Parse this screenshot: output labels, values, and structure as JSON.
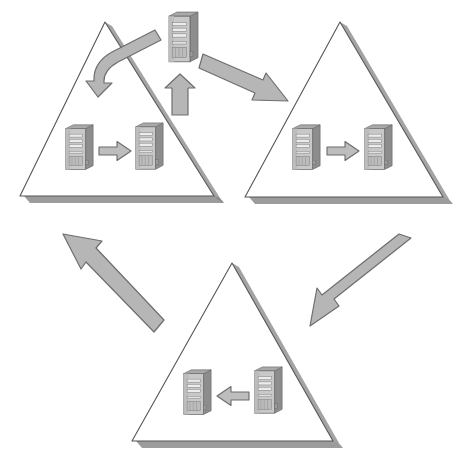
{
  "diagram": {
    "title": "Three-site server replication cycle",
    "type": "cycle-diagram",
    "canvas": {
      "width": 465,
      "height": 466,
      "background": "#ffffff"
    },
    "colors": {
      "triangle_stroke": "#555555",
      "triangle_fill": "#ffffff",
      "shadow": "#9a9a9a",
      "arrow_fill": "#b4b4b4",
      "arrow_stroke": "#6e6e6e",
      "small_arrow_fill": "#bdbdbd",
      "small_arrow_stroke": "#6b6b6b",
      "server_front": "#c9c9c9",
      "server_side": "#8f8f8f",
      "server_top": "#a8a8a8",
      "server_bay": "#e4e4e4",
      "server_outline": "#6a6a6a"
    },
    "groups": [
      {
        "id": "site-top-left",
        "name": "top-left-site",
        "label": "",
        "shape": "triangle",
        "apex": {
          "x": 105,
          "y": 22
        },
        "base_left": {
          "x": 20,
          "y": 196
        },
        "base_right": {
          "x": 214,
          "y": 196
        },
        "servers": [
          {
            "id": "tl-source",
            "name": "source-server",
            "x": 63,
            "y": 123,
            "w": 32,
            "h": 52
          },
          {
            "id": "tl-target",
            "name": "target-server",
            "x": 133,
            "y": 121,
            "w": 32,
            "h": 54
          }
        ],
        "internal_arrow": {
          "direction": "right",
          "x": 98,
          "y": 140,
          "w": 34,
          "h": 22
        }
      },
      {
        "id": "site-top-right",
        "name": "top-right-site",
        "label": "",
        "shape": "triangle",
        "apex": {
          "x": 340,
          "y": 22
        },
        "base_left": {
          "x": 245,
          "y": 197
        },
        "base_right": {
          "x": 443,
          "y": 197
        },
        "servers": [
          {
            "id": "tr-source",
            "name": "source-server",
            "x": 290,
            "y": 123,
            "w": 32,
            "h": 52
          },
          {
            "id": "tr-target",
            "name": "target-server",
            "x": 362,
            "y": 123,
            "w": 32,
            "h": 52
          }
        ],
        "internal_arrow": {
          "direction": "right",
          "x": 326,
          "y": 140,
          "w": 34,
          "h": 22
        }
      },
      {
        "id": "site-bottom",
        "name": "bottom-site",
        "label": "",
        "shape": "triangle",
        "apex": {
          "x": 232,
          "y": 263,
          "y_note": "apex"
        },
        "base_left": {
          "x": 132,
          "y": 441
        },
        "base_right": {
          "x": 333,
          "y": 441
        },
        "servers": [
          {
            "id": "b-target",
            "name": "target-server",
            "x": 181,
            "y": 368,
            "w": 32,
            "h": 52
          },
          {
            "id": "b-source",
            "name": "source-server",
            "x": 252,
            "y": 365,
            "w": 32,
            "h": 54
          }
        ],
        "internal_arrow": {
          "direction": "left",
          "x": 216,
          "y": 385,
          "w": 34,
          "h": 22
        }
      }
    ],
    "hub_server": {
      "id": "hub",
      "name": "central-hub-server",
      "x": 166,
      "y": 10,
      "w": 34,
      "h": 58
    },
    "connectors": [
      {
        "id": "hub-to-top-left",
        "name": "curved-arrow-hub-to-top-left",
        "style": "curved",
        "from": "central-hub-server",
        "to": "top-left-site",
        "direction": "down-left"
      },
      {
        "id": "hub-to-top-right",
        "name": "arrow-hub-to-top-right",
        "style": "straight",
        "from": "central-hub-server",
        "to": "top-right-site",
        "direction": "down-right"
      },
      {
        "id": "top-right-to-bottom",
        "name": "arrow-top-right-to-bottom",
        "style": "straight",
        "from": "top-right-site",
        "to": "bottom-site",
        "direction": "down-left"
      },
      {
        "id": "bottom-to-top-left",
        "name": "arrow-bottom-to-top-left",
        "style": "straight",
        "from": "bottom-site",
        "to": "top-left-site",
        "direction": "up-left"
      },
      {
        "id": "top-left-to-hub",
        "name": "arrow-top-left-to-hub",
        "style": "straight-vertical",
        "from": "top-left-site",
        "to": "central-hub-server",
        "direction": "up"
      }
    ]
  }
}
